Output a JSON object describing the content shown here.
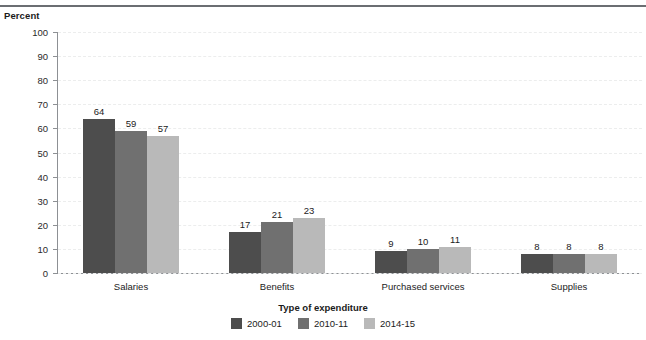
{
  "y_axis_title": "Percent",
  "x_axis_title": "Type of expenditure",
  "chart_data": {
    "type": "bar",
    "title": "",
    "xlabel": "Type of expenditure",
    "ylabel": "Percent",
    "ylim": [
      0,
      100
    ],
    "yticks": [
      0,
      10,
      20,
      30,
      40,
      50,
      60,
      70,
      80,
      90,
      100
    ],
    "grid": true,
    "legend_position": "bottom",
    "categories": [
      "Salaries",
      "Benefits",
      "Purchased services",
      "Supplies"
    ],
    "series": [
      {
        "name": "2000-01",
        "color": "#4d4d4d",
        "values": [
          64,
          17,
          9,
          8
        ]
      },
      {
        "name": "2010-11",
        "color": "#707070",
        "values": [
          59,
          21,
          10,
          8
        ]
      },
      {
        "name": "2014-15",
        "color": "#b9b9b9",
        "values": [
          57,
          23,
          11,
          8
        ]
      }
    ]
  },
  "colors": {
    "axis": "#8d9094",
    "grid": "#eceded",
    "text": "#1b1b1b",
    "rule": "#6b6e72"
  }
}
